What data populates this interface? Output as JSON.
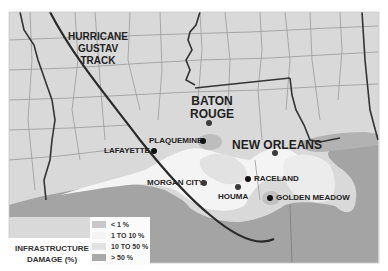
{
  "map": {
    "title_annotation": "HURRICANE GUSTAV TRACK",
    "title_lines": [
      "HURRICANE",
      "GUSTAV",
      "TRACK"
    ],
    "colors": {
      "background": "#ffffff",
      "land_unaffected": "#d9d9d9",
      "damage_lt1": "#c8c8c8",
      "damage_1_10": "#f4f4f4",
      "damage_10_50": "#e2e2e2",
      "damage_gt50": "#a9a9a9",
      "water": "#a4a4a4",
      "track": "#2a2a2a",
      "county_lines": "#9a9a9a",
      "state_lines": "#333333"
    },
    "cities": [
      {
        "name": "BATON ROUGE",
        "lines": [
          "BATON",
          "ROUGE"
        ],
        "size": "big"
      },
      {
        "name": "NEW ORLEANS",
        "size": "big"
      },
      {
        "name": "PLAQUEMINE",
        "size": "small"
      },
      {
        "name": "LAFAYETTE",
        "size": "small"
      },
      {
        "name": "MORGAN CITY",
        "size": "small"
      },
      {
        "name": "HOUMA",
        "size": "small"
      },
      {
        "name": "RACELAND",
        "size": "small"
      },
      {
        "name": "GOLDEN MEADOW",
        "size": "small"
      }
    ]
  },
  "legend": {
    "title_lines": [
      "INFRASTRUCTURE",
      "DAMAGE (%)"
    ],
    "items": [
      {
        "label": "< 1 %",
        "color": "#c8c8c8"
      },
      {
        "label": "1 TO 10 %",
        "color": "#f4f4f4"
      },
      {
        "label": "10 TO 50 %",
        "color": "#e2e2e2"
      },
      {
        "label": "> 50 %",
        "color": "#a9a9a9"
      }
    ]
  }
}
